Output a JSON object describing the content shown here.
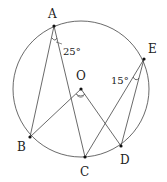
{
  "diagram": {
    "type": "circle-geometry",
    "circle": {
      "center_label": "O",
      "cx": 81,
      "cy": 89,
      "r": 68
    },
    "points": {
      "A": {
        "label": "A",
        "x": 54,
        "y": 26
      },
      "E": {
        "label": "E",
        "x": 144,
        "y": 59
      },
      "O": {
        "label": "O",
        "x": 81,
        "y": 89
      },
      "B": {
        "label": "B",
        "x": 30,
        "y": 137
      },
      "C": {
        "label": "C",
        "x": 85,
        "y": 157
      },
      "D": {
        "label": "D",
        "x": 121,
        "y": 146
      }
    },
    "segments": [
      "AB",
      "AC",
      "OB",
      "OD",
      "EC",
      "ED"
    ],
    "angles": {
      "A": {
        "vertex": "A",
        "value": "25°"
      },
      "E": {
        "vertex": "E",
        "value": "15°"
      },
      "O": {
        "vertex": "O",
        "value": ""
      }
    },
    "colors": {
      "stroke": "#333333",
      "background": "#ffffff"
    }
  }
}
